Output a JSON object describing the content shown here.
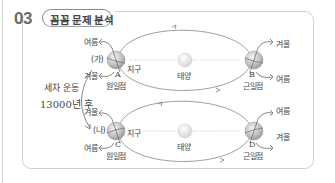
{
  "header": {
    "number": "03",
    "title": "꼼꼼 문제 분석"
  },
  "side_note": {
    "line1": "세차 운동",
    "line2": "13000년 후"
  },
  "diagram_top": {
    "label": "(가)",
    "left_point": {
      "letter": "A",
      "name": "원일점",
      "axis_up": "여름",
      "axis_down": "겨울",
      "earth_label": "지구"
    },
    "sun_label": "태양",
    "right_point": {
      "letter": "B",
      "name": "근일점",
      "axis_up": "겨울",
      "axis_down": "여름"
    }
  },
  "diagram_bottom": {
    "label": "(나)",
    "left_point": {
      "letter": "C",
      "name": "원일점",
      "axis_up": "겨울",
      "axis_down": "여름",
      "earth_label": "지구"
    },
    "sun_label": "태양",
    "right_point": {
      "letter": "D",
      "name": "근일점",
      "axis_up": "여름",
      "axis_down": "겨울"
    }
  },
  "colors": {
    "frame": "#cfcfcf",
    "orbit": "#777777",
    "earth": "#c9c9c9",
    "sun": "#e2e2e2",
    "text": "#444444"
  }
}
